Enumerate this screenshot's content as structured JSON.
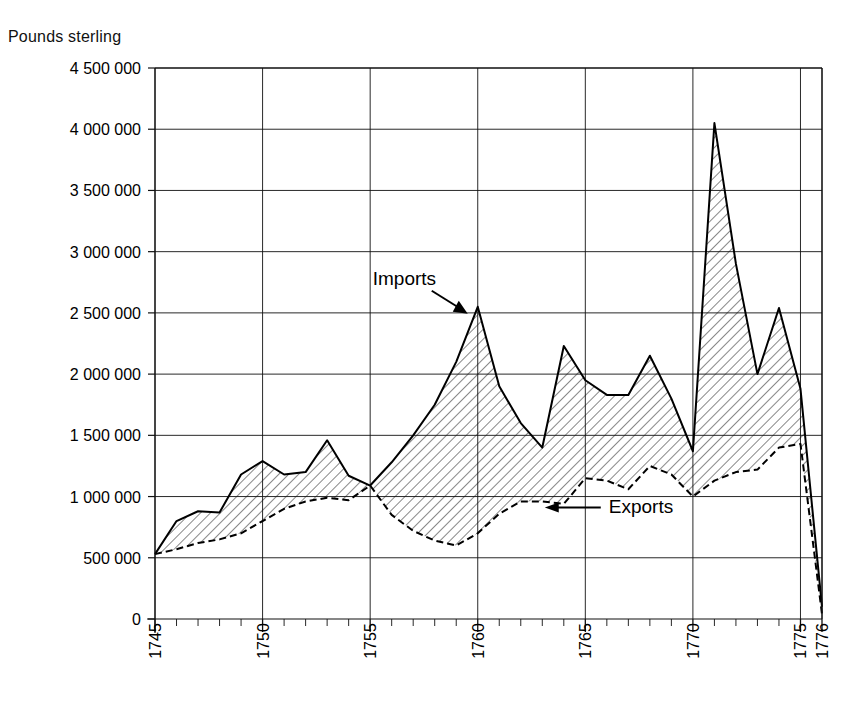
{
  "chart_data": {
    "type": "area",
    "title": "",
    "ylabel": "Pounds sterling",
    "xlabel": "",
    "ylim": [
      0,
      4500000
    ],
    "xlim": [
      1745,
      1776
    ],
    "ytick_step": 500000,
    "grid": true,
    "legend_position": "inline-annotations",
    "ytick_labels": [
      "4 500 000",
      "4 000 000",
      "3 500 000",
      "3 000 000",
      "2 500 000",
      "2 000 000",
      "1 500 000",
      "1 000 000",
      "500 000",
      "0"
    ],
    "ytick_values": [
      4500000,
      4000000,
      3500000,
      3000000,
      2500000,
      2000000,
      1500000,
      1000000,
      500000,
      0
    ],
    "xtick_labels": [
      "1745",
      "1750",
      "1755",
      "1760",
      "1765",
      "1770",
      "1775",
      "1776"
    ],
    "xtick_values": [
      1745,
      1750,
      1755,
      1760,
      1765,
      1770,
      1775,
      1776
    ],
    "x": [
      1745,
      1746,
      1747,
      1748,
      1749,
      1750,
      1751,
      1752,
      1753,
      1754,
      1755,
      1756,
      1757,
      1758,
      1759,
      1760,
      1761,
      1762,
      1763,
      1764,
      1765,
      1766,
      1767,
      1768,
      1769,
      1770,
      1771,
      1772,
      1773,
      1774,
      1775,
      1776
    ],
    "series": [
      {
        "name": "Imports",
        "style": "solid",
        "values": [
          530000,
          800000,
          880000,
          870000,
          1180000,
          1290000,
          1180000,
          1200000,
          1460000,
          1170000,
          1090000,
          1280000,
          1500000,
          1750000,
          2100000,
          2550000,
          1900000,
          1600000,
          1400000,
          2230000,
          1950000,
          1830000,
          1830000,
          2150000,
          1800000,
          1370000,
          4050000,
          2900000,
          2000000,
          2540000,
          1880000,
          100000
        ]
      },
      {
        "name": "Exports",
        "style": "dashed",
        "values": [
          530000,
          570000,
          620000,
          650000,
          700000,
          800000,
          900000,
          960000,
          990000,
          970000,
          1090000,
          850000,
          720000,
          640000,
          600000,
          700000,
          860000,
          960000,
          960000,
          940000,
          1150000,
          1130000,
          1060000,
          1250000,
          1180000,
          1000000,
          1130000,
          1200000,
          1220000,
          1400000,
          1430000,
          40000
        ]
      }
    ],
    "annotations": [
      {
        "text": "Imports",
        "target_x": 1760,
        "target_y": 2550000
      },
      {
        "text": "Exports",
        "target_x": 1762,
        "target_y": 960000
      }
    ]
  }
}
